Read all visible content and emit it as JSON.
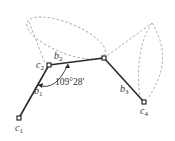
{
  "diagram": {
    "type": "molecular-chain-rotation",
    "atoms": [
      {
        "id": "c1",
        "label": "c",
        "sub": "1"
      },
      {
        "id": "c2",
        "label": "c",
        "sub": "2"
      },
      {
        "id": "c3",
        "label": "",
        "sub": ""
      },
      {
        "id": "c4",
        "label": "c",
        "sub": "4"
      }
    ],
    "bonds": [
      {
        "id": "b1",
        "label": "b",
        "sub": "1"
      },
      {
        "id": "b2",
        "label": "b",
        "sub": "2"
      },
      {
        "id": "b3",
        "label": "b",
        "sub": "3"
      }
    ],
    "angle_label": "109°28′",
    "colors": {
      "bond": "#2a2a2a",
      "dashed": "#9a9a9a",
      "text": "#333333"
    }
  }
}
